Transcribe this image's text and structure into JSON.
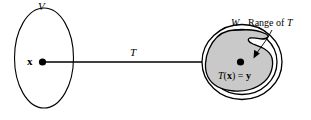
{
  "diagram": {
    "canvas": {
      "width": 311,
      "height": 120,
      "background": "#ffffff"
    },
    "domain": {
      "set_label": "V",
      "element_label": "x",
      "shape": "ellipse",
      "fill": "#ffffff",
      "stroke": "#000000"
    },
    "mapping": {
      "arrow_label": "T",
      "direction": "left-to-right"
    },
    "codomain": {
      "set_label": "W",
      "shape": "double-circle",
      "fill": "#ffffff",
      "stroke": "#000000"
    },
    "range": {
      "annotation": "Range of T",
      "fill": "#c9c9c9",
      "stroke": "#000000",
      "image_label": "T(x) = y",
      "image_label_parts": {
        "function": "T",
        "open_paren": "(",
        "argument": "x",
        "close_paren": ")",
        "equals": "=",
        "value": "y"
      }
    }
  }
}
